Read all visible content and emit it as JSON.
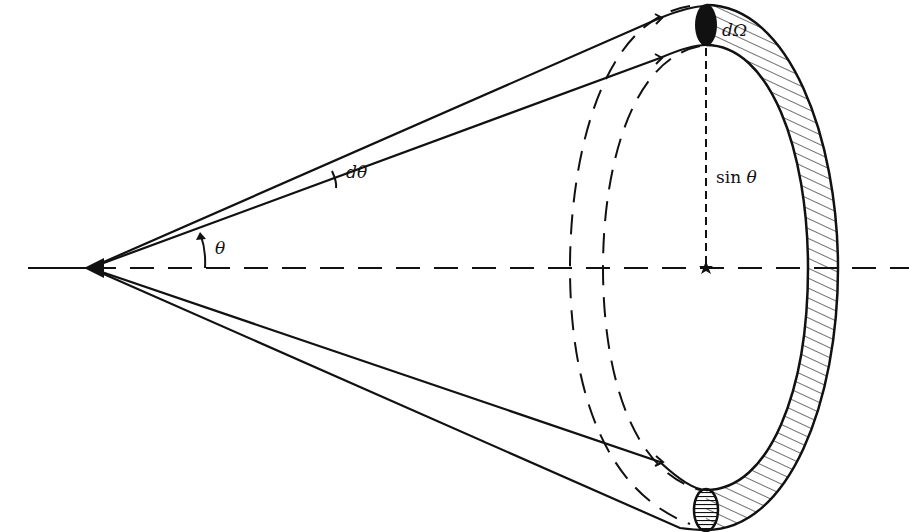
{
  "diagram": {
    "labels": {
      "d_omega": "dΩ",
      "d_theta": "dθ",
      "theta": "θ",
      "sin_theta_fn": "sin",
      "sin_theta_var": "θ"
    },
    "colors": {
      "ink": "#111111",
      "background": "#ffffff"
    },
    "elements": [
      "apex",
      "axis (dashed)",
      "cone generator lines (upper & lower pairs)",
      "angle arc θ with arrow",
      "angle arc dθ",
      "dashed back ellipses",
      "hatched front ring (annular strip)",
      "solid-angle element dΩ (top, filled)",
      "element (bottom, horizontal hatching)",
      "radius marker sin θ (dashed vertical)",
      "center star"
    ]
  }
}
